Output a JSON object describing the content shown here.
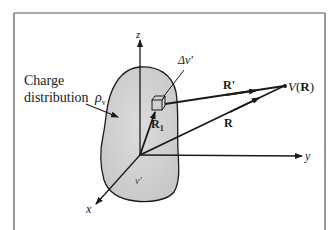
{
  "figure": {
    "type": "potential-due-to-volume-charge-distribution",
    "colors": {
      "line": "#1a1a1a",
      "frame": "#555555",
      "blob_fill": "#d4d4d4",
      "background": "#ffffff"
    }
  },
  "labels": {
    "charge_line1": "Charge",
    "charge_line2": "distribution",
    "rho": "ρ",
    "rho_sub": "v",
    "delta_v": "Δv'",
    "volume": "v'",
    "r_prime": "R'",
    "r": "R",
    "r1": "R",
    "r1_sub": "1",
    "v_of_r_v": "V",
    "v_of_r_open": "(",
    "v_of_r_R": "R",
    "v_of_r_close": ")",
    "axis_z": "z",
    "axis_y": "y",
    "axis_x": "x"
  }
}
